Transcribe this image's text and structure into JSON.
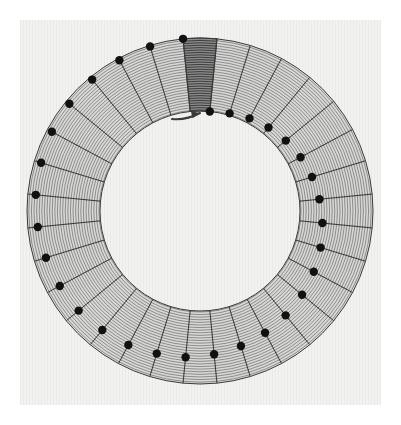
{
  "figure": {
    "description": "Scanned technical figure: a hatched annulus divided into 32 equal radial sectors. One sector at the top is shaded dark. An arrow just inside the inner radius points clockwise. Marker dots lie on the radial sector boundaries and spiral progressively from the outer radius toward the inner radius going clockwise.",
    "background_color": "#f2f2f0",
    "page_color": "#ffffff",
    "ink_color": "#3a3a3a",
    "hatch_color": "#5a5a5a",
    "sector_fill": "#d8d8d6",
    "highlight_fill": "#8c8c8c",
    "highlight_hatch_color": "#2e2e2e",
    "marker_color": "#111111"
  },
  "geometry": {
    "center_x": 200,
    "center_y": 211,
    "outer_radius": 173,
    "inner_radius": 100,
    "sector_count": 32,
    "sector_angle_deg": 11.25,
    "highlight_sector_index": 0,
    "marker_radius_px": 4.2,
    "hatch_spacing_px": 2.6
  },
  "arrow": {
    "label": "clockwise-rotation-arrow",
    "tail_x": 172,
    "tail_y": 119,
    "tip_x": 200,
    "tip_y": 113,
    "direction": "clockwise",
    "stroke_width": 2.0
  },
  "chart_data": {
    "type": "scatter",
    "xlabel": "",
    "ylabel": "",
    "coordinate_system": "polar",
    "grid": false,
    "legend_position": "none",
    "axis_note": "angle measured in degrees clockwise from top (12 o'clock); radius in pixels from centre",
    "rlim": [
      100,
      173
    ],
    "theta_lim_deg": [
      0,
      360
    ],
    "series": [
      {
        "name": "sector boundaries",
        "kind": "radial-lines",
        "angles_deg": [
          -5.625,
          5.625,
          16.875,
          28.125,
          39.375,
          50.625,
          61.875,
          73.125,
          84.375,
          95.625,
          106.875,
          118.125,
          129.375,
          140.625,
          151.875,
          163.125,
          174.375,
          185.625,
          196.875,
          208.125,
          219.375,
          230.625,
          241.875,
          253.125,
          264.375,
          275.625,
          286.875,
          298.125,
          309.375,
          320.625,
          331.875,
          343.125
        ]
      },
      {
        "name": "boundary markers",
        "kind": "dots-on-boundaries",
        "note": "dot radial position decreases monotonically from the outer radius to the inner radius as angle increases clockwise",
        "points": [
          {
            "angle_deg": -5.625,
            "radius": 173
          },
          {
            "angle_deg": 5.625,
            "radius": 100
          },
          {
            "angle_deg": 16.875,
            "radius": 102
          },
          {
            "angle_deg": 28.125,
            "radius": 105
          },
          {
            "angle_deg": 39.375,
            "radius": 108
          },
          {
            "angle_deg": 50.625,
            "radius": 111
          },
          {
            "angle_deg": 61.875,
            "radius": 114
          },
          {
            "angle_deg": 73.125,
            "radius": 117
          },
          {
            "angle_deg": 84.375,
            "radius": 120
          },
          {
            "angle_deg": 95.625,
            "radius": 123
          },
          {
            "angle_deg": 106.875,
            "radius": 126
          },
          {
            "angle_deg": 118.125,
            "radius": 129
          },
          {
            "angle_deg": 129.375,
            "radius": 132
          },
          {
            "angle_deg": 140.625,
            "radius": 135
          },
          {
            "angle_deg": 151.875,
            "radius": 138
          },
          {
            "angle_deg": 163.125,
            "radius": 141
          },
          {
            "angle_deg": 174.375,
            "radius": 144
          },
          {
            "angle_deg": 185.625,
            "radius": 147
          },
          {
            "angle_deg": 196.875,
            "radius": 149
          },
          {
            "angle_deg": 208.125,
            "radius": 152
          },
          {
            "angle_deg": 219.375,
            "radius": 154
          },
          {
            "angle_deg": 230.625,
            "radius": 157
          },
          {
            "angle_deg": 241.875,
            "radius": 159
          },
          {
            "angle_deg": 253.125,
            "radius": 161
          },
          {
            "angle_deg": 264.375,
            "radius": 163
          },
          {
            "angle_deg": 275.625,
            "radius": 165
          },
          {
            "angle_deg": 286.875,
            "radius": 166
          },
          {
            "angle_deg": 298.125,
            "radius": 168
          },
          {
            "angle_deg": 309.375,
            "radius": 169
          },
          {
            "angle_deg": 320.625,
            "radius": 170
          },
          {
            "angle_deg": 331.875,
            "radius": 171
          },
          {
            "angle_deg": 343.125,
            "radius": 172
          }
        ]
      },
      {
        "name": "highlighted sector",
        "kind": "filled-sector",
        "start_angle_deg": -5.625,
        "end_angle_deg": 5.625,
        "inner_radius": 100,
        "outer_radius": 173,
        "fill": "#8c8c8c"
      }
    ]
  }
}
